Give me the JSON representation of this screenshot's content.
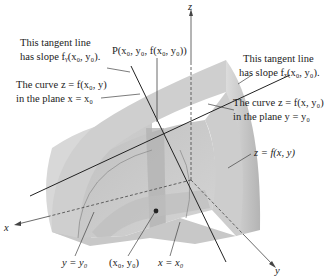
{
  "figure": {
    "axes": {
      "x_label": "x",
      "y_label": "y",
      "z_label": "z"
    },
    "point": {
      "label": "P(x₀, y₀, f(x₀, y₀))"
    },
    "base_point": {
      "label": "(x₀, y₀)"
    },
    "annotations": {
      "tangent_y_line1": "This tangent line",
      "tangent_y_line2": "has slope fᵧ(x₀, y₀).",
      "curve_x0_line1": "The curve z = f(x₀, y)",
      "curve_x0_line2": "in the plane x = x₀",
      "tangent_x_line1": "This tangent line",
      "tangent_x_line2": "has slope fₓ(x₀, y₀).",
      "curve_y0_line1": "The curve z = f(x, y₀)",
      "curve_y0_line2": "in the plane y = y₀",
      "surface": "z = f(x, y)",
      "plane_y0": "y = y₀",
      "plane_x0": "x = x₀"
    },
    "colors": {
      "surface_light": "#d6d6d6",
      "surface_mid": "#c4c4c4",
      "surface_dark": "#b0b0b0",
      "plane_shade": "#a8a8a8",
      "line": "#222222",
      "leader": "#444444"
    }
  }
}
